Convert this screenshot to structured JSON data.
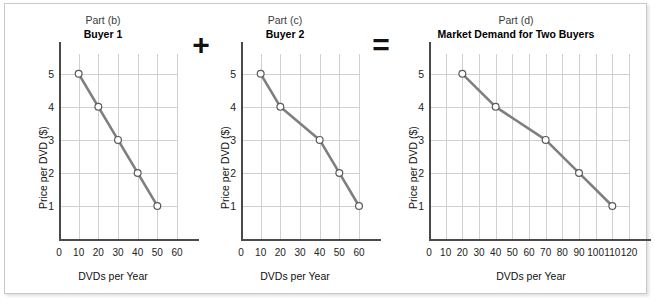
{
  "figure": {
    "operators": [
      {
        "name": "plus",
        "symbol": "+"
      },
      {
        "name": "equals",
        "symbol": "="
      }
    ],
    "axis_titles": {
      "x": "DVDs per Year",
      "y": "Price per DVD ($)"
    },
    "zero_label": "0",
    "colors": {
      "line": "#7f7f7f",
      "marker_fill": "#ffffff",
      "marker_stroke": "#5a5a5a",
      "grid": "#cfcfd4",
      "axis": "#4a4a4a",
      "frame": "#c9c9c9",
      "background": "#ffffff"
    }
  },
  "chart_data": [
    {
      "type": "line",
      "panel": "b",
      "part_label": "Part (b)",
      "title": "Buyer 1",
      "xlabel": "DVDs per Year",
      "ylabel": "Price per DVD ($)",
      "xlim": [
        0,
        60
      ],
      "ylim": [
        0,
        5.6
      ],
      "xticks": [
        0,
        10,
        20,
        30,
        40,
        50,
        60
      ],
      "yticks": [
        1,
        2,
        3,
        4,
        5
      ],
      "grid": true,
      "legend": "none",
      "x": [
        10,
        20,
        30,
        40,
        50
      ],
      "y": [
        5,
        4,
        3,
        2,
        1
      ],
      "points": [
        {
          "quantity": 10,
          "price": 5
        },
        {
          "quantity": 20,
          "price": 4
        },
        {
          "quantity": 30,
          "price": 3
        },
        {
          "quantity": 40,
          "price": 2
        },
        {
          "quantity": 50,
          "price": 1
        }
      ]
    },
    {
      "type": "line",
      "panel": "c",
      "part_label": "Part (c)",
      "title": "Buyer 2",
      "xlabel": "DVDs per Year",
      "ylabel": "Price per DVD ($)",
      "xlim": [
        0,
        60
      ],
      "ylim": [
        0,
        5.6
      ],
      "xticks": [
        0,
        10,
        20,
        30,
        40,
        50,
        60
      ],
      "yticks": [
        1,
        2,
        3,
        4,
        5
      ],
      "grid": true,
      "legend": "none",
      "x": [
        10,
        20,
        40,
        50,
        60
      ],
      "y": [
        5,
        4,
        3,
        2,
        1
      ],
      "points": [
        {
          "quantity": 10,
          "price": 5
        },
        {
          "quantity": 20,
          "price": 4
        },
        {
          "quantity": 40,
          "price": 3
        },
        {
          "quantity": 50,
          "price": 2
        },
        {
          "quantity": 60,
          "price": 1
        }
      ]
    },
    {
      "type": "line",
      "panel": "d",
      "part_label": "Part (d)",
      "title": "Market Demand for Two Buyers",
      "xlabel": "DVDs per Year",
      "ylabel": "Price per DVD ($)",
      "xlim": [
        0,
        120
      ],
      "ylim": [
        0,
        5.6
      ],
      "xticks": [
        0,
        10,
        20,
        30,
        40,
        50,
        60,
        70,
        80,
        90,
        100,
        110,
        120
      ],
      "yticks": [
        1,
        2,
        3,
        4,
        5
      ],
      "grid": true,
      "legend": "none",
      "x": [
        20,
        40,
        70,
        90,
        110
      ],
      "y": [
        5,
        4,
        3,
        2,
        1
      ],
      "points": [
        {
          "quantity": 20,
          "price": 5
        },
        {
          "quantity": 40,
          "price": 4
        },
        {
          "quantity": 70,
          "price": 3
        },
        {
          "quantity": 90,
          "price": 2
        },
        {
          "quantity": 110,
          "price": 1
        }
      ]
    }
  ]
}
